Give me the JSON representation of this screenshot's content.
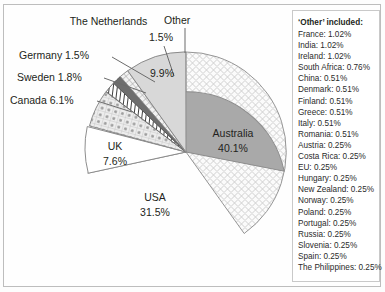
{
  "chart_data": {
    "type": "pie",
    "title": "",
    "legend_position": "right",
    "start_angle_deg": 0,
    "direction": "clockwise",
    "categories": [
      "Australia",
      "USA",
      "UK",
      "Canada",
      "Sweden",
      "Germany",
      "The Netherlands",
      "Other"
    ],
    "values": [
      40.1,
      31.5,
      7.6,
      6.1,
      1.8,
      1.5,
      1.5,
      9.9
    ],
    "value_unit": "%",
    "slice_fill_patterns": [
      "lattice-crosshatch",
      "solid-medium-gray",
      "solid-white",
      "dotted-checker",
      "diagonal-stripes",
      "solid-dark-gray",
      "grid-crosshatch",
      "solid-light-gray"
    ]
  },
  "slices": {
    "australia": {
      "label": "Australia",
      "value": "40.1%"
    },
    "usa": {
      "label": "USA",
      "value": "31.5%"
    },
    "uk": {
      "label": "UK",
      "value": "7.6%"
    },
    "other": {
      "label": "Other",
      "value": "9.9%"
    }
  },
  "callouts": {
    "netherlands": {
      "name": "The Netherlands",
      "value": "1.5%"
    },
    "germany": {
      "text": "Germany 1.5%"
    },
    "sweden": {
      "text": "Sweden 1.8%"
    },
    "canada": {
      "text": "Canada 6.1%"
    }
  },
  "legend": {
    "title": "‘Other’ included:",
    "rows": [
      "France: 1.02%",
      "India: 1.02%",
      "Ireland: 1.02%",
      "South Africa: 0.76%",
      "China: 0.51%",
      "Denmark: 0.51%",
      "Finland: 0.51%",
      "Greece: 0.51%",
      "Italy: 0.51%",
      "Romania: 0.51%",
      "Austria: 0.25%",
      "Costa Rica: 0.25%",
      "EU: 0.25%",
      "Hungary: 0.25%",
      "New Zealand: 0.25%",
      "Norway: 0.25%",
      "Poland: 0.25%",
      "Portugal: 0.25%",
      "Russia: 0.25%",
      "Slovenia: 0.25%",
      "Spain: 0.25%",
      "The Philippines: 0.25%"
    ]
  },
  "colors": {
    "other_fill": "#d8d8d8",
    "usa_fill": "#a9a9a9",
    "germany_fill": "#6e6e6e",
    "uk_fill": "#ffffff",
    "outline": "#8a8a8a",
    "text": "#231f20"
  }
}
